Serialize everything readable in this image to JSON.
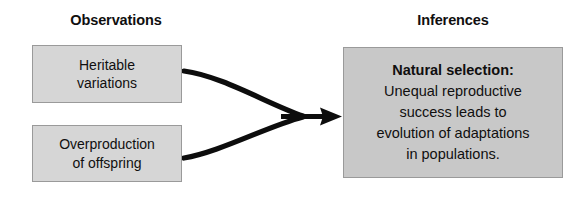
{
  "diagram": {
    "type": "concept-flow",
    "background_color": "#ffffff",
    "columns": [
      {
        "id": "observations",
        "heading": "Observations"
      },
      {
        "id": "inferences",
        "heading": "Inferences"
      }
    ],
    "nodes": [
      {
        "id": "heritable-variations",
        "column": "observations",
        "fill_color": "#d6d6d6",
        "border_color": "#9a9a9a",
        "text_color": "#100f0f",
        "lines": [
          {
            "text": "Heritable",
            "bold": false
          },
          {
            "text": "variations",
            "bold": false
          }
        ]
      },
      {
        "id": "overproduction-of-offspring",
        "column": "observations",
        "fill_color": "#d6d6d6",
        "border_color": "#9a9a9a",
        "text_color": "#100f0f",
        "lines": [
          {
            "text": "Overproduction",
            "bold": false
          },
          {
            "text": "of offspring",
            "bold": false
          }
        ]
      },
      {
        "id": "natural-selection",
        "column": "inferences",
        "fill_color": "#c8c8c8",
        "border_color": "#9a9a9a",
        "text_color": "#100f0f",
        "lines": [
          {
            "text": "Natural selection:",
            "bold": true
          },
          {
            "text": "Unequal reproductive",
            "bold": false
          },
          {
            "text": "success leads to",
            "bold": false
          },
          {
            "text": "evolution of adaptations",
            "bold": false
          },
          {
            "text": "in populations.",
            "bold": false
          }
        ]
      }
    ],
    "connectors": [
      {
        "id": "arrow-heritable-to-natural-selection",
        "from": "heritable-variations",
        "to": "natural-selection",
        "style": "curved",
        "color": "#0d0d0d",
        "arrowhead": "merged"
      },
      {
        "id": "arrow-overproduction-to-natural-selection",
        "from": "overproduction-of-offspring",
        "to": "natural-selection",
        "style": "curved",
        "color": "#0d0d0d",
        "arrowhead": "merged"
      }
    ]
  }
}
